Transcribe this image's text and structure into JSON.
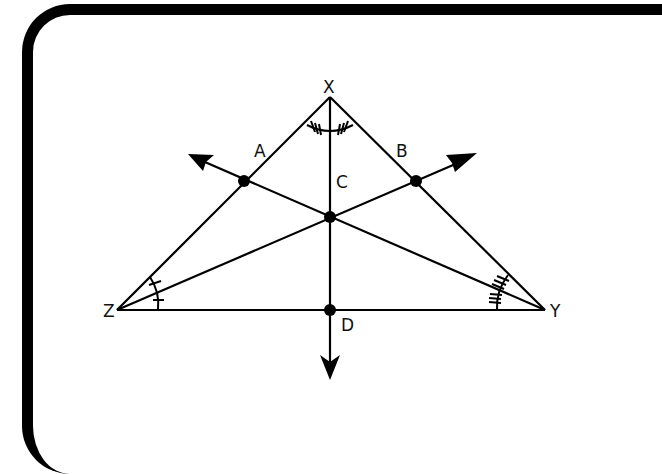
{
  "diagram": {
    "type": "triangle-angle-bisectors",
    "colors": {
      "stroke": "#000000",
      "background": "#ffffff"
    },
    "vertices": [
      {
        "label": "X",
        "x": 330,
        "y": 97
      },
      {
        "label": "Y",
        "x": 545,
        "y": 310
      },
      {
        "label": "Z",
        "x": 117,
        "y": 310
      }
    ],
    "points": [
      {
        "label": "A",
        "x": 244,
        "y": 181,
        "on": "XZ"
      },
      {
        "label": "B",
        "x": 416,
        "y": 181,
        "on": "XY"
      },
      {
        "label": "C",
        "x": 330,
        "y": 217,
        "role": "incenter"
      },
      {
        "label": "D",
        "x": 330,
        "y": 310,
        "on": "ZY"
      }
    ],
    "rays": [
      {
        "from": "Y",
        "through": "A",
        "arrow_end": {
          "x": 190,
          "y": 155
        }
      },
      {
        "from": "Z",
        "through": "B",
        "arrow_end": {
          "x": 475,
          "y": 155
        }
      },
      {
        "from": "X",
        "through": "D",
        "arrow_end": {
          "x": 330,
          "y": 378
        }
      }
    ],
    "angle_marks": [
      {
        "vertex": "X",
        "ticks": 3,
        "description": "angle bisected into two congruent halves"
      },
      {
        "vertex": "Z",
        "ticks": 1,
        "description": "angle bisected into two congruent halves"
      },
      {
        "vertex": "Y",
        "ticks": 3,
        "description": "angle bisected into two congruent halves"
      }
    ],
    "labels": {
      "X": "X",
      "Y": "Y",
      "Z": "Z",
      "A": "A",
      "B": "B",
      "C": "C",
      "D": "D"
    }
  }
}
